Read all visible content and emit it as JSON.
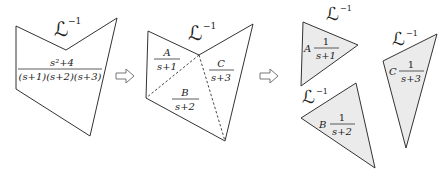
{
  "diagram": {
    "colors": {
      "stroke": "#333333",
      "triangle_fill": "#ebebeb",
      "arrow_stroke": "#777777",
      "background": "#ffffff"
    },
    "step1": {
      "operator": "ℒ",
      "operator_exponent": "−1",
      "numerator": "s²+4",
      "denominator": "(s+1)(s+2)(s+3)"
    },
    "step2": {
      "operator": "ℒ",
      "operator_exponent": "−1",
      "terms": [
        {
          "numerator": "A",
          "denominator": "s+1"
        },
        {
          "numerator": "B",
          "denominator": "s+2"
        },
        {
          "numerator": "C",
          "denominator": "s+3"
        }
      ]
    },
    "step3": {
      "pieces": [
        {
          "operator": "ℒ",
          "operator_exponent": "−1",
          "coefficient": "A",
          "numerator": "1",
          "denominator": "s+1"
        },
        {
          "operator": "ℒ",
          "operator_exponent": "−1",
          "coefficient": "B",
          "numerator": "1",
          "denominator": "s+2"
        },
        {
          "operator": "ℒ",
          "operator_exponent": "−1",
          "coefficient": "C",
          "numerator": "1",
          "denominator": "s+3"
        }
      ]
    },
    "arrows": [
      {
        "direction": "right"
      },
      {
        "direction": "right"
      }
    ]
  }
}
